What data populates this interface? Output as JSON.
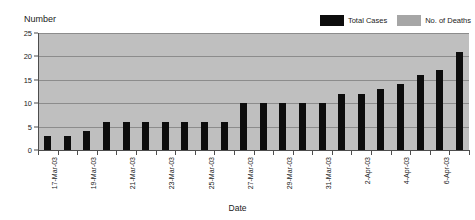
{
  "chart": {
    "title": "Total No. of Cases & No. of Deaths: Taiwan",
    "ylabel": "Number",
    "xlabel": "Date"
  },
  "legend": {
    "items": [
      {
        "label": "Total Cases",
        "color": "#0d0d0d",
        "name": "total-cases"
      },
      {
        "label": "No. of Deaths",
        "color": "#a6a6a6",
        "name": "no-of-deaths"
      }
    ]
  },
  "axis": {
    "y_ticks": [
      "0",
      "5",
      "10",
      "15",
      "20",
      "25"
    ],
    "x_tick_labels": [
      "17-Mar-03",
      "",
      "19-Mar-03",
      "",
      "21-Mar-03",
      "",
      "23-Mar-03",
      "",
      "25-Mar-03",
      "",
      "27-Mar-03",
      "",
      "29-Mar-03",
      "",
      "31-Mar-03",
      "",
      "2-Apr-03",
      "",
      "4-Apr-03",
      "",
      "6-Apr-03",
      ""
    ]
  },
  "chart_data": {
    "type": "bar",
    "title": "Total No. of Cases & No. of Deaths: Taiwan",
    "xlabel": "Date",
    "ylabel": "Number",
    "ylim": [
      0,
      25
    ],
    "ytick_step": 5,
    "grid": true,
    "legend_position": "top-right",
    "plot_background": "#bfbfbf",
    "categories": [
      "17-Mar-03",
      "18-Mar-03",
      "19-Mar-03",
      "20-Mar-03",
      "21-Mar-03",
      "22-Mar-03",
      "23-Mar-03",
      "24-Mar-03",
      "25-Mar-03",
      "26-Mar-03",
      "27-Mar-03",
      "28-Mar-03",
      "29-Mar-03",
      "30-Mar-03",
      "31-Mar-03",
      "1-Apr-03",
      "2-Apr-03",
      "3-Apr-03",
      "4-Apr-03",
      "5-Apr-03",
      "6-Apr-03",
      "7-Apr-03"
    ],
    "series": [
      {
        "name": "Total Cases",
        "color": "#0d0d0d",
        "values": [
          3,
          3,
          4,
          6,
          6,
          6,
          6,
          6,
          6,
          6,
          10,
          10,
          10,
          10,
          10,
          12,
          12,
          13,
          14,
          16,
          17,
          21
        ]
      },
      {
        "name": "No. of Deaths",
        "color": "#a6a6a6",
        "values": [
          0,
          0,
          0,
          0,
          0,
          0,
          0,
          0,
          0,
          0,
          0,
          0,
          0,
          0,
          0,
          0,
          0,
          0,
          0,
          0,
          0,
          0
        ]
      }
    ]
  }
}
